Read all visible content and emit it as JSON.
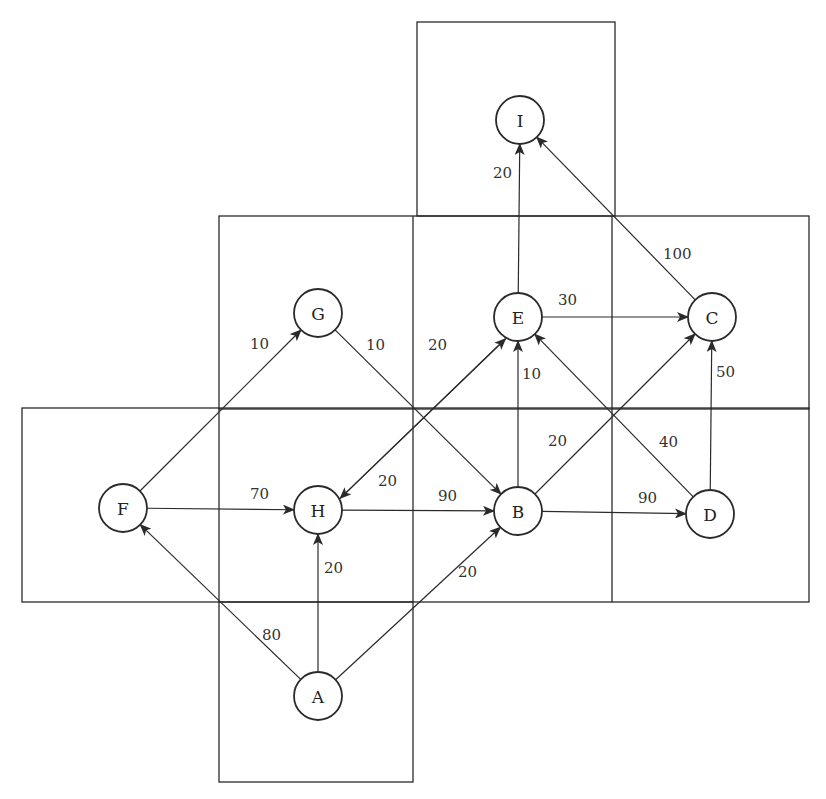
{
  "diagram": {
    "type": "directed-weighted-graph",
    "colors": {
      "stroke": "#2a2a2a",
      "background": "#ffffff",
      "text": "#222222"
    },
    "regions": [
      {
        "id": "top",
        "x": 417,
        "y": 22,
        "w": 198,
        "h": 194
      },
      {
        "id": "upper-band",
        "x": 219,
        "y": 216,
        "w": 590,
        "h": 193
      },
      {
        "id": "lower-band",
        "x": 22,
        "y": 408,
        "w": 787,
        "h": 194
      },
      {
        "id": "bottom",
        "x": 219,
        "y": 602,
        "w": 194,
        "h": 180
      },
      {
        "id": "v-line-413",
        "x1": 413,
        "y1": 216,
        "x2": 413,
        "y2": 602
      },
      {
        "id": "v-line-612",
        "x1": 612,
        "y1": 216,
        "x2": 612,
        "y2": 602
      },
      {
        "id": "v-line-219",
        "x1": 219,
        "y1": 408,
        "x2": 219,
        "y2": 602
      }
    ],
    "nodes": [
      {
        "id": "I",
        "label": "I",
        "x": 520,
        "y": 120
      },
      {
        "id": "G",
        "label": "G",
        "x": 318,
        "y": 313
      },
      {
        "id": "E",
        "label": "E",
        "x": 518,
        "y": 317
      },
      {
        "id": "C",
        "label": "C",
        "x": 712,
        "y": 317
      },
      {
        "id": "F",
        "label": "F",
        "x": 123,
        "y": 508
      },
      {
        "id": "H",
        "label": "H",
        "x": 318,
        "y": 510
      },
      {
        "id": "B",
        "label": "B",
        "x": 518,
        "y": 511
      },
      {
        "id": "D",
        "label": "D",
        "x": 710,
        "y": 514
      },
      {
        "id": "A",
        "label": "A",
        "x": 318,
        "y": 696
      }
    ],
    "edges": [
      {
        "from": "E",
        "to": "I",
        "weight": "20",
        "lx": 493,
        "ly": 178
      },
      {
        "from": "C",
        "to": "I",
        "weight": "100",
        "lx": 663,
        "ly": 259
      },
      {
        "from": "F",
        "to": "G",
        "weight": "10",
        "lx": 250,
        "ly": 349
      },
      {
        "from": "G",
        "to": "B",
        "weight": "10",
        "lx": 366,
        "ly": 350
      },
      {
        "from": "E",
        "to": "C",
        "weight": "30",
        "lx": 558,
        "ly": 305
      },
      {
        "from": "E",
        "to": "H",
        "weight": "20",
        "lx": 428,
        "ly": 350,
        "offset": -7
      },
      {
        "from": "H",
        "to": "E",
        "weight": "20",
        "lx": 378,
        "ly": 486,
        "offset": 7
      },
      {
        "from": "B",
        "to": "E",
        "weight": "10",
        "lx": 522,
        "ly": 379
      },
      {
        "from": "D",
        "to": "C",
        "weight": "50",
        "lx": 716,
        "ly": 377
      },
      {
        "from": "B",
        "to": "C",
        "weight": "20",
        "lx": 548,
        "ly": 446
      },
      {
        "from": "D",
        "to": "E",
        "weight": "40",
        "lx": 659,
        "ly": 447
      },
      {
        "from": "F",
        "to": "H",
        "weight": "70",
        "lx": 250,
        "ly": 499
      },
      {
        "from": "H",
        "to": "B",
        "weight": "90",
        "lx": 438,
        "ly": 501
      },
      {
        "from": "B",
        "to": "D",
        "weight": "90",
        "lx": 638,
        "ly": 503
      },
      {
        "from": "A",
        "to": "H",
        "weight": "20",
        "lx": 324,
        "ly": 573
      },
      {
        "from": "A",
        "to": "B",
        "weight": "20",
        "lx": 458,
        "ly": 577
      },
      {
        "from": "A",
        "to": "F",
        "weight": "80",
        "lx": 262,
        "ly": 640
      }
    ]
  }
}
